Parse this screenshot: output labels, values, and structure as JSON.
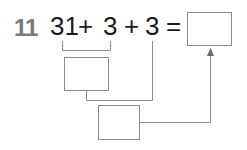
{
  "problem": {
    "number": "11",
    "terms": [
      "31",
      "+",
      "3",
      "+",
      "3",
      "="
    ],
    "answer_box": "",
    "partial_sum_box": "",
    "final_sum_box": ""
  },
  "colors": {
    "number": "#7a7a7a",
    "text": "#1a1a1a",
    "lines": "#8a8a8a"
  }
}
